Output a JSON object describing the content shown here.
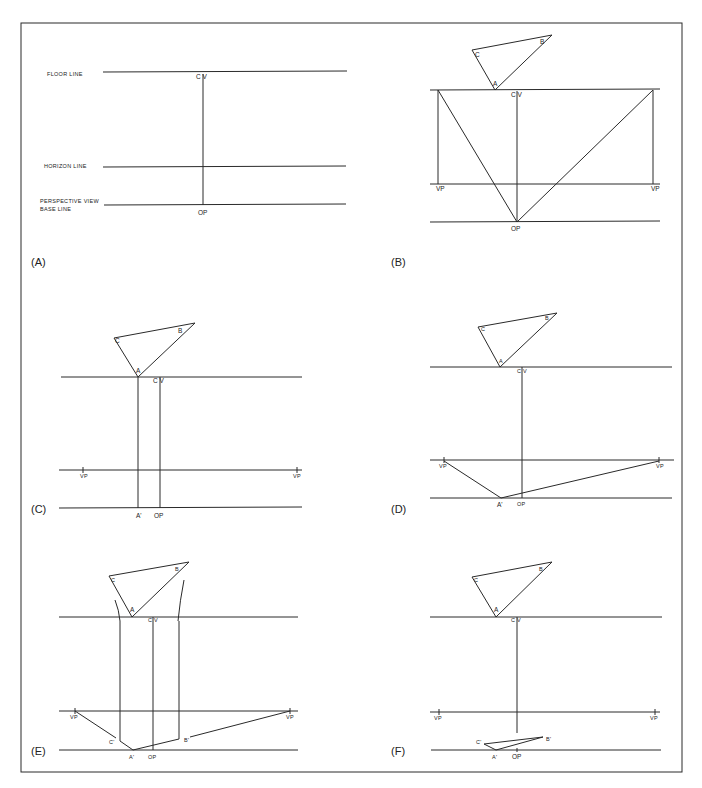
{
  "figure": {
    "border_color": "#2a2a2a",
    "line_color": "#2a2a2a",
    "panels": [
      {
        "id": "A",
        "label": "(A)",
        "line_labels": {
          "floor": "FLOOR LINE",
          "horizon": "HORIZON LINE",
          "base_1": "PERSPECTIVE VIEW",
          "base_2": "BASE LINE"
        },
        "points": {
          "cv": "C V",
          "op": "OP"
        }
      },
      {
        "id": "B",
        "label": "(B)",
        "triangle": {
          "a": "A",
          "b": "B",
          "c": "C"
        },
        "points": {
          "cv": "C V",
          "op": "OP",
          "vp_left": "VP",
          "vp_right": "VP"
        }
      },
      {
        "id": "C",
        "label": "(C)",
        "triangle": {
          "a": "A",
          "b": "B",
          "c": "C"
        },
        "points": {
          "cv": "C V",
          "op": "OP",
          "vp_left": "VP",
          "vp_right": "VP",
          "a_prime": "A'"
        }
      },
      {
        "id": "D",
        "label": "(D)",
        "triangle": {
          "a": "A",
          "b": "B",
          "c": "C"
        },
        "points": {
          "cv": "C V",
          "op": "OP",
          "vp_left": "VP",
          "vp_right": "VP",
          "a_prime": "A'"
        }
      },
      {
        "id": "E",
        "label": "(E)",
        "triangle": {
          "a": "A",
          "b": "B",
          "c": "C"
        },
        "points": {
          "cv": "C V",
          "op": "OP",
          "vp_left": "VP",
          "vp_right": "VP",
          "a_prime": "A'",
          "b_prime": "B'",
          "c_prime": "C'"
        }
      },
      {
        "id": "F",
        "label": "(F)",
        "triangle": {
          "a": "A",
          "b": "B",
          "c": "C"
        },
        "points": {
          "cv": "C V",
          "op": "OP",
          "vp_left": "VP",
          "vp_right": "VP",
          "a_prime": "A'",
          "b_prime": "B'",
          "c_prime": "C'"
        }
      }
    ]
  }
}
